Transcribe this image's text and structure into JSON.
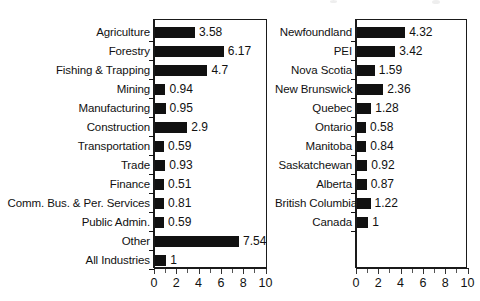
{
  "figure": {
    "background": "#ffffff",
    "bar_color": "#111111",
    "axis_color": "#1a1a1a"
  },
  "chart_data": [
    {
      "type": "bar",
      "orientation": "horizontal",
      "title": "",
      "subtitle": "",
      "xlabel": "",
      "ylabel": "",
      "xlim": [
        0,
        10
      ],
      "xticks": [
        0,
        2,
        4,
        6,
        8,
        10
      ],
      "xticklabels": [
        "0",
        "2",
        "4",
        "6",
        "8",
        "10"
      ],
      "minor_tick_step": 1,
      "grid": false,
      "legend": "none",
      "categories": [
        "Agriculture",
        "Forestry",
        "Fishing & Trapping",
        "Mining",
        "Manufacturing",
        "Construction",
        "Transportation",
        "Trade",
        "Finance",
        "Comm. Bus. & Per. Services",
        "Public Admin.",
        "Other",
        "All Industries"
      ],
      "values": [
        3.58,
        6.17,
        4.7,
        0.94,
        0.95,
        2.9,
        0.59,
        0.93,
        0.51,
        0.81,
        0.59,
        7.54,
        1
      ],
      "value_labels": [
        "3.58",
        "6.17",
        "4.7",
        "0.94",
        "0.95",
        "2.9",
        "0.59",
        "0.93",
        "0.51",
        "0.81",
        "0.59",
        "7.54",
        "1"
      ]
    },
    {
      "type": "bar",
      "orientation": "horizontal",
      "title": "",
      "subtitle": "",
      "xlabel": "",
      "ylabel": "",
      "xlim": [
        0,
        10
      ],
      "xticks": [
        0,
        2,
        4,
        6,
        8,
        10
      ],
      "xticklabels": [
        "0",
        "2",
        "4",
        "6",
        "8",
        "10"
      ],
      "minor_tick_step": 1,
      "grid": false,
      "legend": "none",
      "categories": [
        "Newfoundland",
        "PEI",
        "Nova Scotia",
        "New Brunswick",
        "Quebec",
        "Ontario",
        "Manitoba",
        "Saskatchewan",
        "Alberta",
        "British Columbia",
        "Canada"
      ],
      "values": [
        4.32,
        3.42,
        1.59,
        2.36,
        1.28,
        0.58,
        0.84,
        0.92,
        0.87,
        1.22,
        1
      ],
      "value_labels": [
        "4.32",
        "3.42",
        "1.59",
        "2.36",
        "1.28",
        "0.58",
        "0.84",
        "0.92",
        "0.87",
        "1.22",
        "1"
      ]
    }
  ]
}
